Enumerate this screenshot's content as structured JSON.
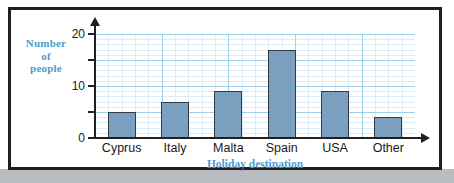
{
  "chart_data": {
    "type": "bar",
    "title": "",
    "subtitle": "",
    "categories": [
      "Cyprus",
      "Italy",
      "Malta",
      "Spain",
      "USA",
      "Other"
    ],
    "values": [
      5,
      7,
      9,
      17,
      9,
      4
    ],
    "xlabel": "Holiday destination",
    "ylabel": "Number of people",
    "ylabel_lines": [
      "Number",
      "of",
      "people"
    ],
    "ylim": [
      0,
      20
    ],
    "ytick_labels": [
      "0",
      "10",
      "20"
    ],
    "ytick_values": [
      0,
      10,
      20
    ],
    "yticks_minor_values": [
      5,
      15
    ],
    "grid": true,
    "grid_major_step": 5,
    "grid_minor_step": 1,
    "legend": "none",
    "axis_arrows": true,
    "colors": {
      "bar_fill": "#7a9fbf",
      "bar_stroke": "#2f3b46",
      "axis": "#231f20",
      "label_blue": "#4f9ccc",
      "grid_major": "#9fd2ea",
      "grid_minor": "#d9ecf7",
      "frame": "#231f20",
      "page_band": "#b9bcc0"
    }
  }
}
